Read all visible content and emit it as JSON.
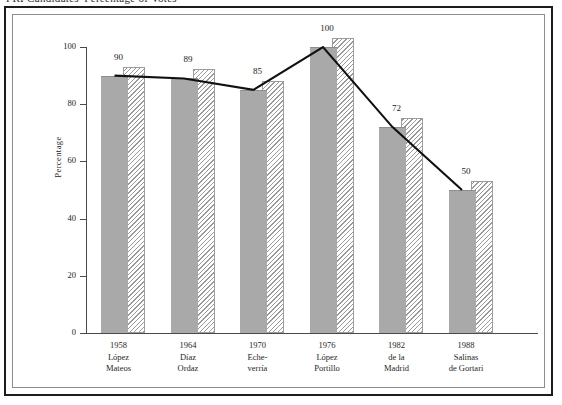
{
  "caption": {
    "text": "PRI Candidates' Percentage of Votes"
  },
  "chart_data": {
    "type": "bar",
    "title": "",
    "subtitle": "",
    "xlabel": "",
    "ylabel": "Percentage",
    "ylim": [
      0,
      100
    ],
    "yticks": [
      0,
      20,
      40,
      60,
      80,
      100
    ],
    "ytick_labels": [
      "0",
      "20",
      "40",
      "60",
      "80",
      "100"
    ],
    "grid": false,
    "legend": "none",
    "categories": [
      "1958 López Mateos",
      "1964 Díaz Ordaz",
      "1970 Echeverría",
      "1976 López Portillo",
      "1982 de la Madrid",
      "1988 Salinas de Gortari"
    ],
    "values": [
      90,
      89,
      85,
      100,
      72,
      50
    ],
    "data_labels": [
      "90",
      "89",
      "85",
      "100",
      "72",
      "50"
    ],
    "overlay_line": {
      "name": "Percentage of votes",
      "values": [
        90,
        89,
        85,
        100,
        72,
        50
      ]
    },
    "series": [
      {
        "name": "Percentage of votes",
        "values": [
          90,
          89,
          85,
          100,
          72,
          50
        ]
      }
    ]
  },
  "axis": {
    "y_label": "Percentage",
    "ticks": [
      {
        "value": 100,
        "label": "100"
      },
      {
        "value": 80,
        "label": "80"
      },
      {
        "value": 60,
        "label": "60"
      },
      {
        "value": 40,
        "label": "40"
      },
      {
        "value": 20,
        "label": "20"
      },
      {
        "value": 0,
        "label": "0"
      }
    ]
  },
  "categories": [
    {
      "year": "1958",
      "name_line1": "López",
      "name_line2": "Mateos",
      "value": 90,
      "label": "90"
    },
    {
      "year": "1964",
      "name_line1": "Díaz",
      "name_line2": "Ordaz",
      "value": 89,
      "label": "89"
    },
    {
      "year": "1970",
      "name_line1": "Eche-",
      "name_line2": "verría",
      "value": 85,
      "label": "85"
    },
    {
      "year": "1976",
      "name_line1": "López",
      "name_line2": "Portillo",
      "value": 100,
      "label": "100"
    },
    {
      "year": "1982",
      "name_line1": "de la",
      "name_line2": "Madrid",
      "value": 72,
      "label": "72"
    },
    {
      "year": "1988",
      "name_line1": "Salinas",
      "name_line2": "de Gortari",
      "value": 50,
      "label": "50"
    }
  ],
  "colors": {
    "bar_fill": "#a9a9a9",
    "hatch_stroke": "#9a9a9a",
    "line": "#111111",
    "frame_outer": "#1c1c1c",
    "frame_inner": "#8d8d8d",
    "text": "#1f1f1f"
  }
}
